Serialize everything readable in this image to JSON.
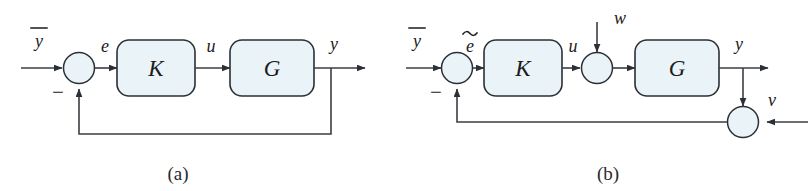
{
  "figure": {
    "type": "control-block-diagram",
    "background_color": "#ffffff",
    "line_color": "#3a3f45",
    "block_fill_color": "#eaf3f8",
    "block_stroke_color": "#2b2f36",
    "junction_fill_color": "#eaf3f8",
    "text_color": "#1b1b20"
  },
  "panels": [
    {
      "id": "a",
      "caption": "(a)",
      "blocks": [
        {
          "name": "controller",
          "label": "K"
        },
        {
          "name": "plant",
          "label": "G"
        }
      ],
      "junctions": [
        {
          "name": "error-sum",
          "sign_label": "−"
        }
      ],
      "signals": [
        {
          "name": "reference",
          "label": "y",
          "overline": true
        },
        {
          "name": "error",
          "label": "e"
        },
        {
          "name": "control",
          "label": "u"
        },
        {
          "name": "output",
          "label": "y"
        }
      ]
    },
    {
      "id": "b",
      "caption": "(b)",
      "blocks": [
        {
          "name": "controller",
          "label": "K"
        },
        {
          "name": "plant",
          "label": "G"
        }
      ],
      "junctions": [
        {
          "name": "error-sum",
          "sign_label": "−"
        },
        {
          "name": "disturbance-sum",
          "sign_label": ""
        },
        {
          "name": "noise-sum",
          "sign_label": ""
        }
      ],
      "signals": [
        {
          "name": "reference",
          "label": "y",
          "overline": true
        },
        {
          "name": "error",
          "label": "e",
          "tilde": true
        },
        {
          "name": "control",
          "label": "u"
        },
        {
          "name": "disturbance",
          "label": "w"
        },
        {
          "name": "output",
          "label": "y"
        },
        {
          "name": "measurement-noise",
          "label": "v"
        }
      ]
    }
  ]
}
